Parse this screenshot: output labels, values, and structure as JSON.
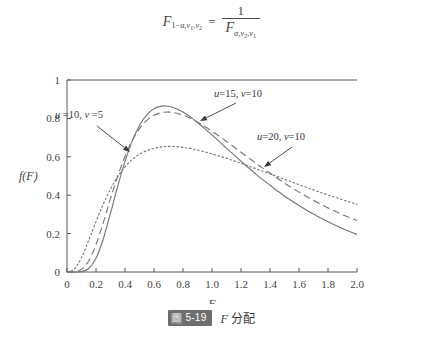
{
  "formula": {
    "lhs_symbol": "F",
    "lhs_subscript": "1−α, ν1, ν2",
    "equals": "=",
    "numerator": "1",
    "denominator_symbol": "F",
    "denominator_subscript": "α, ν2, ν1",
    "parts": {
      "one_minus_alpha": "1−α,",
      "nu": "ν",
      "one": "1",
      "two": "2",
      "alpha": "α,",
      "comma": ","
    }
  },
  "caption": {
    "badge_glyph": "圖",
    "badge_number": "5-19",
    "symbol": "F",
    "text": "分配"
  },
  "annotations": [
    {
      "id": "annot-u10-v5",
      "label": "u =10, v =5",
      "u_symbol": "u",
      "u_value": " =10,",
      "v_symbol": "v",
      "v_value": " =5",
      "text_x": 79,
      "text_y": 54,
      "arrow": {
        "x1": 97,
        "y1": 62,
        "x2": 130,
        "y2": 88
      }
    },
    {
      "id": "annot-u15-v10",
      "label": "u=15, v=10",
      "u_symbol": "u",
      "u_value": "=15,",
      "v_symbol": "v",
      "v_value": "=10",
      "text_x": 238,
      "text_y": 33,
      "arrow": {
        "x1": 236,
        "y1": 39,
        "x2": 200,
        "y2": 57
      }
    },
    {
      "id": "annot-u20-v10",
      "label": "u=20, v=10",
      "u_symbol": "u",
      "u_value": "=20,",
      "v_symbol": "v",
      "v_value": "=10",
      "text_x": 281,
      "text_y": 76,
      "arrow": {
        "x1": 292,
        "y1": 83,
        "x2": 264,
        "y2": 103
      }
    }
  ],
  "chart_data": {
    "type": "line",
    "title": "",
    "xlabel": "F",
    "ylabel": "f(F)",
    "xlim": [
      0,
      2.0
    ],
    "ylim": [
      0,
      1
    ],
    "grid": false,
    "legend": "annotations-inline",
    "xticks": [
      "0",
      "0.2",
      "0.4",
      "0.6",
      "0.8",
      "1.0",
      "1.2",
      "1.4",
      "1.6",
      "1.8",
      "2.0"
    ],
    "xtick_values": [
      0,
      0.2,
      0.4,
      0.6,
      0.8,
      1.0,
      1.2,
      1.4,
      1.6,
      1.8,
      2.0
    ],
    "yticks": [
      "0",
      "0.2",
      "0.4",
      "0.6",
      "0.8",
      "1"
    ],
    "ytick_values": [
      0,
      0.2,
      0.4,
      0.6,
      0.8,
      1.0
    ],
    "x": [
      0.0,
      0.05,
      0.1,
      0.15,
      0.2,
      0.25,
      0.3,
      0.35,
      0.4,
      0.45,
      0.5,
      0.55,
      0.6,
      0.65,
      0.7,
      0.75,
      0.8,
      0.85,
      0.9,
      0.95,
      1.0,
      1.05,
      1.1,
      1.15,
      1.2,
      1.25,
      1.3,
      1.35,
      1.4,
      1.45,
      1.5,
      1.55,
      1.6,
      1.65,
      1.7,
      1.75,
      1.8,
      1.85,
      1.9,
      1.95,
      2.0
    ],
    "series": [
      {
        "name": "u=10, v=5",
        "u": 10,
        "v": 5,
        "style": "dotted",
        "peak_x": 0.72,
        "peak_y": 0.66,
        "values": [
          0.0,
          0.015,
          0.075,
          0.165,
          0.262,
          0.353,
          0.432,
          0.497,
          0.548,
          0.586,
          0.613,
          0.632,
          0.644,
          0.651,
          0.654,
          0.653,
          0.649,
          0.643,
          0.635,
          0.626,
          0.615,
          0.604,
          0.592,
          0.579,
          0.566,
          0.552,
          0.539,
          0.525,
          0.511,
          0.497,
          0.483,
          0.469,
          0.455,
          0.441,
          0.428,
          0.414,
          0.401,
          0.389,
          0.376,
          0.364,
          0.352
        ]
      },
      {
        "name": "u=15, v=10",
        "u": 15,
        "v": 10,
        "style": "dashed",
        "peak_x": 0.78,
        "peak_y": 0.82,
        "values": [
          0.0,
          0.001,
          0.014,
          0.059,
          0.143,
          0.256,
          0.382,
          0.5,
          0.602,
          0.685,
          0.747,
          0.79,
          0.816,
          0.83,
          0.833,
          0.828,
          0.817,
          0.801,
          0.781,
          0.758,
          0.733,
          0.707,
          0.68,
          0.652,
          0.624,
          0.596,
          0.568,
          0.541,
          0.514,
          0.488,
          0.463,
          0.439,
          0.416,
          0.394,
          0.373,
          0.353,
          0.334,
          0.316,
          0.299,
          0.283,
          0.268
        ]
      },
      {
        "name": "u=20, v=10",
        "u": 20,
        "v": 10,
        "style": "solid",
        "peak_x": 0.8,
        "peak_y": 0.85,
        "values": [
          0.0,
          0.0,
          0.002,
          0.018,
          0.071,
          0.172,
          0.306,
          0.447,
          0.576,
          0.683,
          0.763,
          0.818,
          0.85,
          0.864,
          0.863,
          0.852,
          0.833,
          0.808,
          0.779,
          0.747,
          0.714,
          0.68,
          0.645,
          0.611,
          0.577,
          0.544,
          0.512,
          0.481,
          0.452,
          0.423,
          0.396,
          0.371,
          0.346,
          0.323,
          0.302,
          0.281,
          0.262,
          0.244,
          0.227,
          0.211,
          0.196
        ]
      }
    ]
  },
  "plot_geometry": {
    "left": 67,
    "top": 16,
    "width": 290,
    "height": 192
  }
}
